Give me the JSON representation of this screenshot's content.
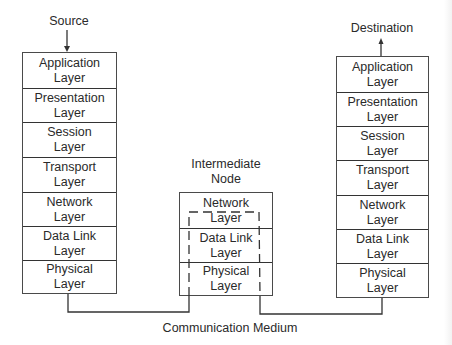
{
  "diagram": {
    "source_label": "Source",
    "destination_label": "Destination",
    "intermediate_label_line1": "Intermediate",
    "intermediate_label_line2": "Node",
    "medium_label": "Communication Medium",
    "source_stack": [
      {
        "name": "Application",
        "suffix": "Layer"
      },
      {
        "name": "Presentation",
        "suffix": "Layer"
      },
      {
        "name": "Session",
        "suffix": "Layer"
      },
      {
        "name": "Transport",
        "suffix": "Layer"
      },
      {
        "name": "Network",
        "suffix": "Layer"
      },
      {
        "name": "Data Link",
        "suffix": "Layer"
      },
      {
        "name": "Physical",
        "suffix": "Layer"
      }
    ],
    "intermediate_stack": [
      {
        "name": "Network",
        "suffix": "Layer"
      },
      {
        "name": "Data Link",
        "suffix": "Layer"
      },
      {
        "name": "Physical",
        "suffix": "Layer"
      }
    ],
    "destination_stack": [
      {
        "name": "Application",
        "suffix": "Layer"
      },
      {
        "name": "Presentation",
        "suffix": "Layer"
      },
      {
        "name": "Session",
        "suffix": "Layer"
      },
      {
        "name": "Transport",
        "suffix": "Layer"
      },
      {
        "name": "Network",
        "suffix": "Layer"
      },
      {
        "name": "Data Link",
        "suffix": "Layer"
      },
      {
        "name": "Physical",
        "suffix": "Layer"
      }
    ],
    "colors": {
      "line": "#333333",
      "text": "#2a2a2a",
      "background": "#ffffff"
    }
  }
}
